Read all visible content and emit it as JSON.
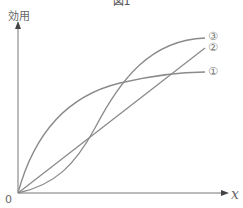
{
  "figure": {
    "title": "図1",
    "y_axis_label": "効用",
    "x_axis_label": "x",
    "origin_label": "0",
    "curves": [
      {
        "id": "1",
        "label": "①",
        "shape": "concave (diminishing marginal utility)"
      },
      {
        "id": "2",
        "label": "②",
        "shape": "linear (constant marginal utility)"
      },
      {
        "id": "3",
        "label": "③",
        "shape": "S-shaped (increasing then decreasing)"
      }
    ],
    "colors": {
      "axis": "#777777",
      "curve": "#8a8a8a"
    }
  }
}
